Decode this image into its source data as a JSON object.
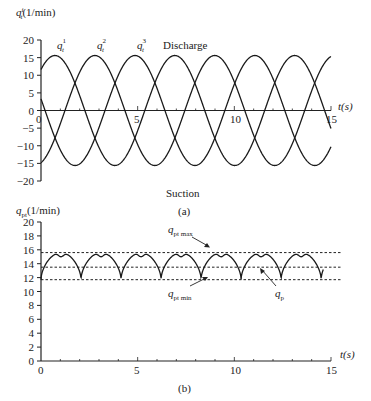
{
  "chart_data": [
    {
      "panel": "a",
      "type": "line",
      "caption": "(a)",
      "ylabel": "q_t^i (1/min)",
      "xlabel": "t(s)",
      "xlim": [
        0,
        15
      ],
      "ylim": [
        -20,
        20
      ],
      "xticks": [
        0,
        5,
        10,
        15
      ],
      "yticks": [
        20,
        15,
        10,
        5,
        0,
        -5,
        -10,
        -15,
        -20
      ],
      "grid": false,
      "annotations": [
        "Discharge",
        "Suction"
      ],
      "series": [
        {
          "name": "q_t^1",
          "label_base": "q",
          "label_sub": "t",
          "label_sup": "1",
          "amplitude": 15.6,
          "period_s": 6.2,
          "peak_time_s": 0.72
        },
        {
          "name": "q_t^2",
          "label_base": "q",
          "label_sub": "t",
          "label_sup": "2",
          "amplitude": 15.6,
          "period_s": 6.2,
          "peak_time_s": 2.79
        },
        {
          "name": "q_t^3",
          "label_base": "q",
          "label_sub": "t",
          "label_sup": "3",
          "amplitude": 15.6,
          "period_s": 6.2,
          "peak_time_s": 4.86
        }
      ]
    },
    {
      "panel": "b",
      "type": "line",
      "caption": "(b)",
      "ylabel": "q_pt (1/min)",
      "xlabel": "t(s)",
      "xlim": [
        0,
        15
      ],
      "ylim": [
        0,
        20
      ],
      "xticks": [
        0,
        5,
        10,
        15
      ],
      "yticks": [
        20,
        18,
        16,
        14,
        12,
        10,
        8,
        6,
        4,
        2,
        0
      ],
      "grid": false,
      "series": [
        {
          "name": "q_p",
          "min": 11.7,
          "max": 15.6,
          "mid_dip": 15.0,
          "ripple_period_s": 2.07
        }
      ],
      "reference_lines": [
        {
          "name": "q_pt max",
          "value": 15.6,
          "style": "dashed"
        },
        {
          "name": "q_pt mean",
          "value": 13.5,
          "style": "dashed"
        },
        {
          "name": "q_pt min",
          "value": 11.7,
          "style": "dashed"
        }
      ],
      "annotations": [
        "q_pt max",
        "q_pt min",
        "q_p"
      ]
    }
  ],
  "labels": {
    "a": {
      "ylabel_base": "q",
      "ylabel_sub": "t",
      "ylabel_sup": "i",
      "ylabel_unit": "(1/min)",
      "discharge": "Discharge",
      "suction": "Suction",
      "caption": "(a)",
      "xlabel": "t(s)",
      "xtick_0": "0",
      "xtick_5": "5",
      "xtick_10": "10",
      "xtick_15": "15"
    },
    "b": {
      "ylabel_base": "q",
      "ylabel_sub": "pt",
      "ylabel_unit": "(1/min)",
      "qmax_base": "q",
      "qmax_sub": "pt max",
      "qmin_base": "q",
      "qmin_sub": "pt min",
      "qp_base": "q",
      "qp_sub": "p",
      "caption": "(b)",
      "xlabel": "t(s)",
      "xtick_0": "0",
      "xtick_5": "5",
      "xtick_10": "10",
      "xtick_15": "15"
    }
  }
}
